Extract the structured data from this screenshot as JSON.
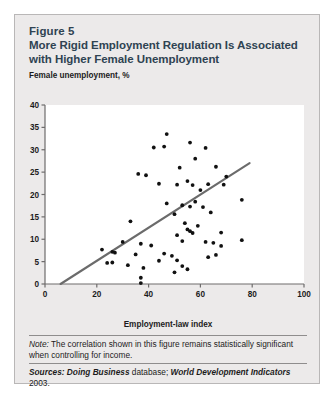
{
  "figure": {
    "label": "Figure 5",
    "title": "More Rigid Employment Regulation Is Associated with Higher Female Unemployment",
    "note_label": "Note:",
    "note_text": " The correlation shown in this figure remains statistically significant when controlling for income.",
    "sources_label": "Sources:",
    "sources_part1": " Doing Business",
    "sources_part2": " database; ",
    "sources_part3": "World Development Indicators",
    "sources_part4": " 2003."
  },
  "colors": {
    "card_background": "#eceaea",
    "card_border": "#b9b7b7",
    "title_color": "#2f4352",
    "plot_background": "#ffffff",
    "axis_color": "#6e6c6c",
    "point_color": "#111111",
    "trendline_color": "#6b6b6b"
  },
  "chart_data": {
    "type": "scatter",
    "title": "More Rigid Employment Regulation Is Associated with Higher Female Unemployment",
    "xlabel": "Employment-law index",
    "ylabel": "Female unemployment, %",
    "xlim": [
      0,
      100
    ],
    "ylim": [
      0,
      40
    ],
    "xticks": [
      0,
      20,
      40,
      60,
      80,
      100
    ],
    "yticks": [
      0,
      5,
      10,
      15,
      20,
      25,
      30,
      35,
      40
    ],
    "grid": false,
    "legend": null,
    "trendline": {
      "label": "linear fit",
      "x_start": 6,
      "y_start": 0,
      "x_end": 79,
      "y_end": 27
    },
    "points": [
      {
        "x": 47,
        "y": 33.5
      },
      {
        "x": 42,
        "y": 30.5
      },
      {
        "x": 46,
        "y": 30.7
      },
      {
        "x": 56,
        "y": 31.6
      },
      {
        "x": 62,
        "y": 30.4
      },
      {
        "x": 58,
        "y": 28.0
      },
      {
        "x": 36,
        "y": 24.6
      },
      {
        "x": 39,
        "y": 24.3
      },
      {
        "x": 52,
        "y": 26.0
      },
      {
        "x": 66,
        "y": 26.2
      },
      {
        "x": 70,
        "y": 24.0
      },
      {
        "x": 55,
        "y": 23.0
      },
      {
        "x": 51,
        "y": 22.2
      },
      {
        "x": 57,
        "y": 22.1
      },
      {
        "x": 44,
        "y": 22.4
      },
      {
        "x": 60,
        "y": 21.0
      },
      {
        "x": 63,
        "y": 22.3
      },
      {
        "x": 69,
        "y": 22.2
      },
      {
        "x": 76,
        "y": 18.8
      },
      {
        "x": 47,
        "y": 18.0
      },
      {
        "x": 53,
        "y": 17.6
      },
      {
        "x": 56,
        "y": 17.3
      },
      {
        "x": 58,
        "y": 18.4
      },
      {
        "x": 61,
        "y": 17.2
      },
      {
        "x": 50,
        "y": 15.6
      },
      {
        "x": 64,
        "y": 16.0
      },
      {
        "x": 33,
        "y": 14.0
      },
      {
        "x": 54,
        "y": 13.6
      },
      {
        "x": 59,
        "y": 13.0
      },
      {
        "x": 55,
        "y": 12.2
      },
      {
        "x": 56,
        "y": 11.8
      },
      {
        "x": 57,
        "y": 11.4
      },
      {
        "x": 51,
        "y": 10.9
      },
      {
        "x": 30,
        "y": 9.4
      },
      {
        "x": 37,
        "y": 9.0
      },
      {
        "x": 41,
        "y": 8.6
      },
      {
        "x": 53,
        "y": 9.6
      },
      {
        "x": 62,
        "y": 9.4
      },
      {
        "x": 65,
        "y": 9.2
      },
      {
        "x": 68,
        "y": 8.5
      },
      {
        "x": 22,
        "y": 7.7
      },
      {
        "x": 26,
        "y": 7.2
      },
      {
        "x": 27,
        "y": 7.0
      },
      {
        "x": 35,
        "y": 6.6
      },
      {
        "x": 46,
        "y": 6.8
      },
      {
        "x": 49,
        "y": 6.3
      },
      {
        "x": 63,
        "y": 6.0
      },
      {
        "x": 66,
        "y": 6.5
      },
      {
        "x": 24,
        "y": 4.7
      },
      {
        "x": 26,
        "y": 4.8
      },
      {
        "x": 32,
        "y": 4.2
      },
      {
        "x": 44,
        "y": 5.2
      },
      {
        "x": 51,
        "y": 5.3
      },
      {
        "x": 53,
        "y": 4.0
      },
      {
        "x": 55,
        "y": 3.3
      },
      {
        "x": 50,
        "y": 2.6
      },
      {
        "x": 38,
        "y": 3.6
      },
      {
        "x": 37,
        "y": 1.4
      },
      {
        "x": 37,
        "y": 0.2
      },
      {
        "x": 68,
        "y": 11.5
      },
      {
        "x": 76,
        "y": 9.8
      }
    ]
  },
  "axis_labels": {
    "y": [
      "40",
      "35",
      "30",
      "25",
      "20",
      "15",
      "10",
      "5",
      "0"
    ],
    "x": [
      "0",
      "20",
      "40",
      "60",
      "80",
      "100"
    ]
  }
}
